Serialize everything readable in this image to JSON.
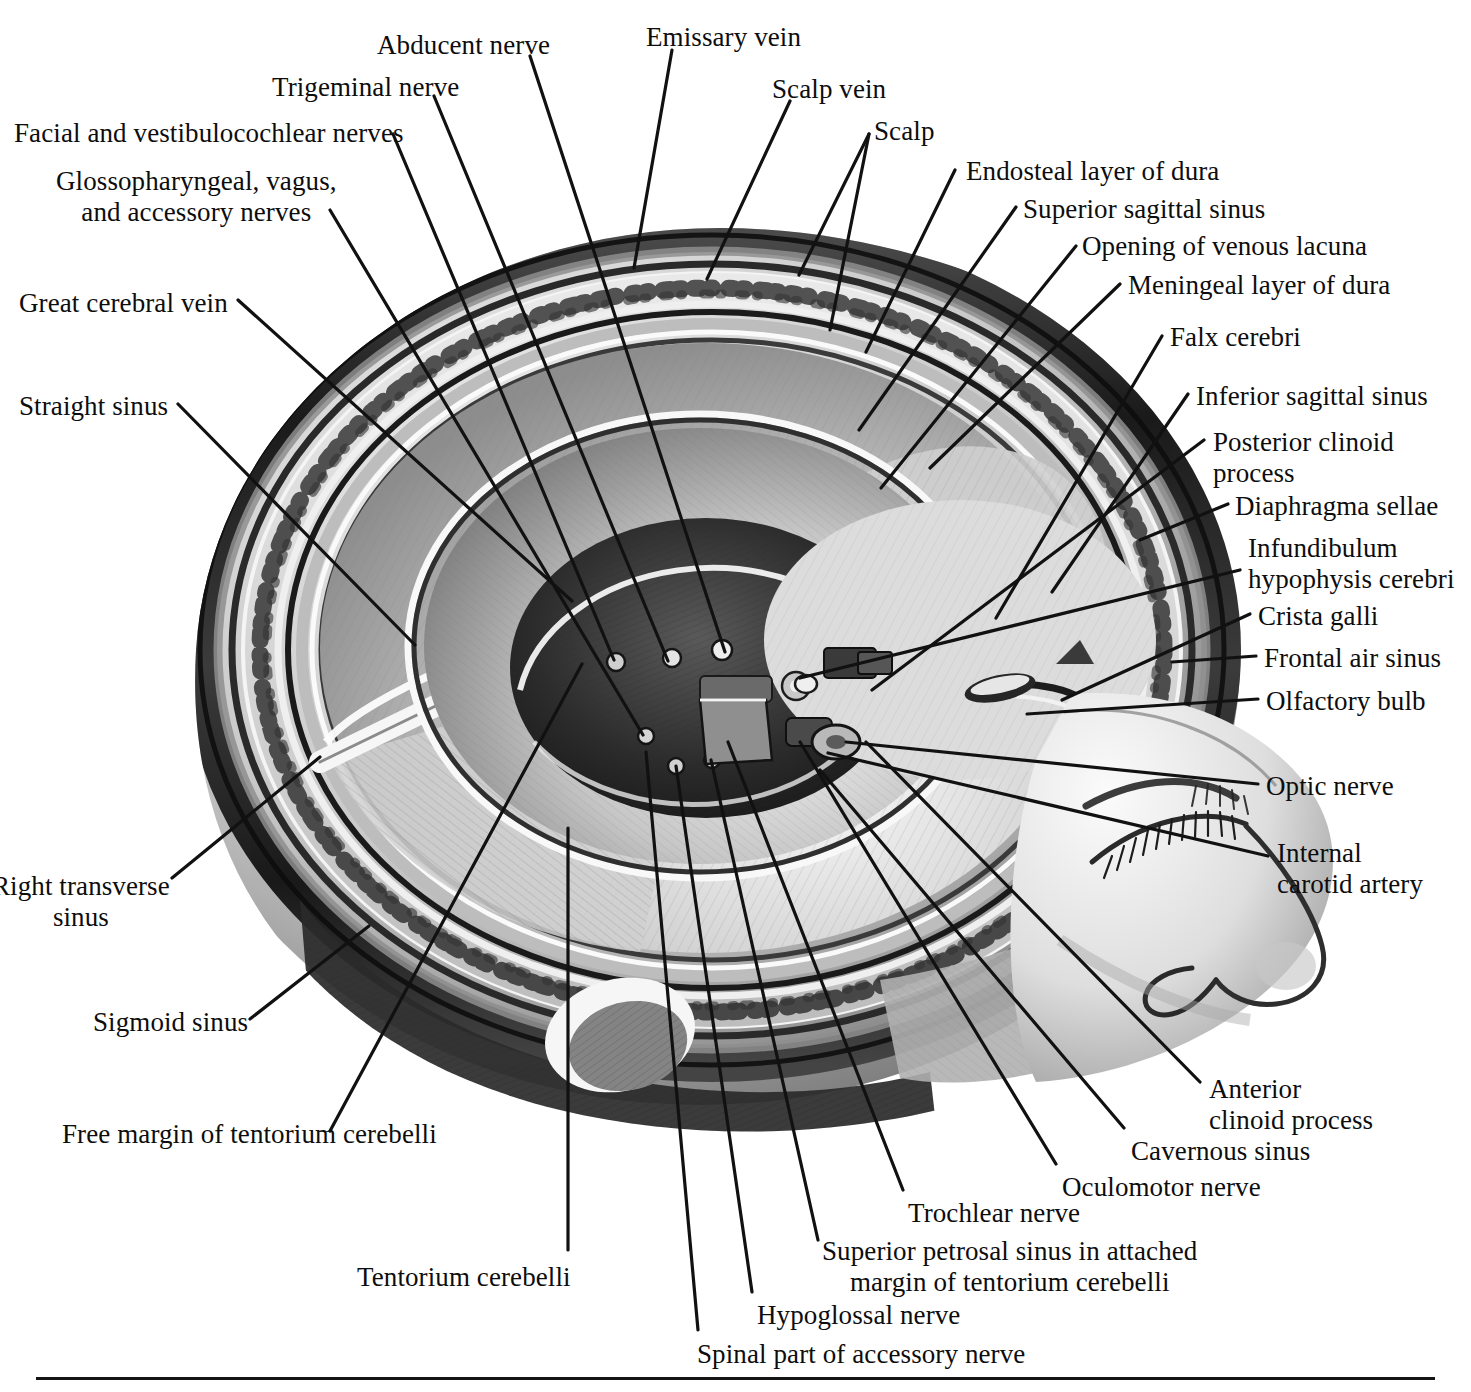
{
  "figure": {
    "domain": "anatomy-illustration",
    "style": "monochrome halftone engraving",
    "background_color": "#ffffff",
    "ink_color": "#0d0d0d",
    "leader_line_color": "#111111"
  },
  "labels": [
    {
      "id": "facial-vestibulocochlear-nerves",
      "text": "Facial and vestibulocochlear nerves",
      "lines": [
        "Facial and vestibulocochlear nerves"
      ],
      "align": "left",
      "x": 14,
      "y": 118
    },
    {
      "id": "glossopharyngeal-vagus-accessory-nerves",
      "text": "Glossopharyngeal, vagus, and accessory nerves",
      "lines": [
        "Glossopharyngeal, vagus,",
        "and accessory nerves"
      ],
      "align": "center",
      "x": 56,
      "y": 166
    },
    {
      "id": "trigeminal-nerve",
      "text": "Trigeminal nerve",
      "lines": [
        "Trigeminal nerve"
      ],
      "align": "left",
      "x": 272,
      "y": 72
    },
    {
      "id": "abducent-nerve",
      "text": "Abducent nerve",
      "lines": [
        "Abducent nerve"
      ],
      "align": "left",
      "x": 377,
      "y": 30
    },
    {
      "id": "emissary-vein",
      "text": "Emissary vein",
      "lines": [
        "Emissary vein"
      ],
      "align": "left",
      "x": 646,
      "y": 22
    },
    {
      "id": "scalp-vein",
      "text": "Scalp vein",
      "lines": [
        "Scalp vein"
      ],
      "align": "left",
      "x": 772,
      "y": 74
    },
    {
      "id": "scalp",
      "text": "Scalp",
      "lines": [
        "Scalp"
      ],
      "align": "left",
      "x": 874,
      "y": 116
    },
    {
      "id": "endosteal-layer-of-dura",
      "text": "Endosteal layer of dura",
      "lines": [
        "Endosteal layer of dura"
      ],
      "align": "left",
      "x": 966,
      "y": 156
    },
    {
      "id": "superior-sagittal-sinus",
      "text": "Superior sagittal sinus",
      "lines": [
        "Superior sagittal sinus"
      ],
      "align": "left",
      "x": 1023,
      "y": 194
    },
    {
      "id": "opening-of-venous-lacuna",
      "text": "Opening of venous lacuna",
      "lines": [
        "Opening of venous lacuna"
      ],
      "align": "left",
      "x": 1082,
      "y": 231
    },
    {
      "id": "meningeal-layer-of-dura",
      "text": "Meningeal layer of dura",
      "lines": [
        "Meningeal layer of dura"
      ],
      "align": "left",
      "x": 1128,
      "y": 270
    },
    {
      "id": "falx-cerebri",
      "text": "Falx cerebri",
      "lines": [
        "Falx cerebri"
      ],
      "align": "left",
      "x": 1170,
      "y": 322
    },
    {
      "id": "inferior-sagittal-sinus",
      "text": "Inferior sagittal sinus",
      "lines": [
        "Inferior sagittal sinus"
      ],
      "align": "left",
      "x": 1196,
      "y": 381
    },
    {
      "id": "posterior-clinoid-process",
      "text": "Posterior clinoid process",
      "lines": [
        "Posterior clinoid",
        "process"
      ],
      "align": "left",
      "x": 1213,
      "y": 427
    },
    {
      "id": "diaphragma-sellae",
      "text": "Diaphragma sellae",
      "lines": [
        "Diaphragma sellae"
      ],
      "align": "left",
      "x": 1235,
      "y": 491
    },
    {
      "id": "infundibulum-hypophysis-cerebri",
      "text": "Infundibulum hypophysis cerebri",
      "lines": [
        "Infundibulum",
        "hypophysis cerebri"
      ],
      "align": "left",
      "x": 1248,
      "y": 533
    },
    {
      "id": "crista-galli",
      "text": "Crista galli",
      "lines": [
        "Crista galli"
      ],
      "align": "left",
      "x": 1258,
      "y": 601
    },
    {
      "id": "frontal-air-sinus",
      "text": "Frontal air sinus",
      "lines": [
        "Frontal air sinus"
      ],
      "align": "left",
      "x": 1264,
      "y": 643
    },
    {
      "id": "olfactory-bulb",
      "text": "Olfactory bulb",
      "lines": [
        "Olfactory bulb"
      ],
      "align": "left",
      "x": 1266,
      "y": 686
    },
    {
      "id": "optic-nerve",
      "text": "Optic nerve",
      "lines": [
        "Optic nerve"
      ],
      "align": "left",
      "x": 1266,
      "y": 771
    },
    {
      "id": "internal-carotid-artery",
      "text": "Internal carotid artery",
      "lines": [
        "Internal",
        "carotid artery"
      ],
      "align": "left",
      "x": 1277,
      "y": 838
    },
    {
      "id": "great-cerebral-vein",
      "text": "Great cerebral vein",
      "lines": [
        "Great cerebral vein"
      ],
      "align": "left",
      "x": 19,
      "y": 288
    },
    {
      "id": "straight-sinus",
      "text": "Straight sinus",
      "lines": [
        "Straight sinus"
      ],
      "align": "left",
      "x": 19,
      "y": 391
    },
    {
      "id": "right-transverse-sinus",
      "text": "Right transverse sinus",
      "lines": [
        "Right transverse",
        "sinus"
      ],
      "align": "center",
      "x": -8,
      "y": 871
    },
    {
      "id": "sigmoid-sinus",
      "text": "Sigmoid sinus",
      "lines": [
        "Sigmoid sinus"
      ],
      "align": "left",
      "x": 93,
      "y": 1007
    },
    {
      "id": "free-margin-of-tentorium-cerebelli",
      "text": "Free margin of tentorium cerebelli",
      "lines": [
        "Free margin of tentorium cerebelli"
      ],
      "align": "left",
      "x": 62,
      "y": 1119
    },
    {
      "id": "tentorium-cerebelli",
      "text": "Tentorium cerebelli",
      "lines": [
        "Tentorium cerebelli"
      ],
      "align": "left",
      "x": 357,
      "y": 1262
    },
    {
      "id": "spinal-part-of-accessory-nerve",
      "text": "Spinal part of accessory nerve",
      "lines": [
        "Spinal part of accessory nerve"
      ],
      "align": "left",
      "x": 697,
      "y": 1339
    },
    {
      "id": "hypoglossal-nerve",
      "text": "Hypoglossal nerve",
      "lines": [
        "Hypoglossal nerve"
      ],
      "align": "left",
      "x": 757,
      "y": 1300
    },
    {
      "id": "superior-petrosal-sinus",
      "text": "Superior petrosal sinus in attached margin of tentorium cerebelli",
      "lines": [
        "Superior petrosal sinus in attached",
        "margin of tentorium cerebelli"
      ],
      "align": "center",
      "x": 822,
      "y": 1236
    },
    {
      "id": "trochlear-nerve",
      "text": "Trochlear nerve",
      "lines": [
        "Trochlear nerve"
      ],
      "align": "left",
      "x": 908,
      "y": 1198
    },
    {
      "id": "oculomotor-nerve",
      "text": "Oculomotor nerve",
      "lines": [
        "Oculomotor nerve"
      ],
      "align": "left",
      "x": 1062,
      "y": 1172
    },
    {
      "id": "cavernous-sinus",
      "text": "Cavernous sinus",
      "lines": [
        "Cavernous sinus"
      ],
      "align": "left",
      "x": 1131,
      "y": 1136
    },
    {
      "id": "anterior-clinoid-process",
      "text": "Anterior clinoid process",
      "lines": [
        "Anterior",
        "clinoid process"
      ],
      "align": "left",
      "x": 1209,
      "y": 1074
    }
  ],
  "leader_lines": [
    {
      "id": "leader-facial-vestibulocochlear",
      "points": "393,134 614,660"
    },
    {
      "id": "leader-glossopharyngeal",
      "points": "330,210 643,735"
    },
    {
      "id": "leader-trigeminal",
      "points": "434,96 668,661"
    },
    {
      "id": "leader-abducent",
      "points": "530,56 725,652"
    },
    {
      "id": "leader-emissary",
      "points": "672,50 634,268"
    },
    {
      "id": "leader-scalp-vein",
      "points": "790,101 707,279"
    },
    {
      "id": "leader-scalp-a",
      "points": "869,134 799,275"
    },
    {
      "id": "leader-scalp-b",
      "points": "869,134 830,330"
    },
    {
      "id": "leader-endosteal",
      "points": "955,170 866,352"
    },
    {
      "id": "leader-superior-sagittal",
      "points": "1016,207 859,430"
    },
    {
      "id": "leader-opening-venous-lacuna",
      "points": "1076,246 881,488"
    },
    {
      "id": "leader-meningeal",
      "points": "1120,284 930,468"
    },
    {
      "id": "leader-falx",
      "points": "1162,336 996,618"
    },
    {
      "id": "leader-inferior-sagittal",
      "points": "1188,394 1052,592"
    },
    {
      "id": "leader-posterior-clinoid",
      "points": "1204,440 872,690"
    },
    {
      "id": "leader-diaphragma",
      "points": "1228,504 1140,540"
    },
    {
      "id": "leader-infundibulum",
      "points": "1240,570 800,678"
    },
    {
      "id": "leader-crista-galli",
      "points": "1250,614 1062,700"
    },
    {
      "id": "leader-frontal-air-sinus",
      "points": "1256,656 1172,662"
    },
    {
      "id": "leader-olfactory-bulb",
      "points": "1258,699 1027,714"
    },
    {
      "id": "leader-optic-nerve",
      "points": "1258,784 846,742"
    },
    {
      "id": "leader-internal-carotid",
      "points": "1268,856 828,753"
    },
    {
      "id": "leader-great-cerebral-vein",
      "points": "238,300 572,601"
    },
    {
      "id": "leader-straight-sinus",
      "points": "178,404 415,645"
    },
    {
      "id": "leader-right-transverse",
      "points": "172,878 320,757"
    },
    {
      "id": "leader-sigmoid-sinus",
      "points": "250,1019 369,926"
    },
    {
      "id": "leader-free-margin-tentorium",
      "points": "330,1131 582,664"
    },
    {
      "id": "leader-tentorium-cerebelli",
      "points": "568,1250 568,828"
    },
    {
      "id": "leader-spinal-accessory",
      "points": "698,1330 646,752"
    },
    {
      "id": "leader-hypoglossal",
      "points": "752,1292 676,766"
    },
    {
      "id": "leader-superior-petrosal",
      "points": "818,1240 711,760"
    },
    {
      "id": "leader-trochlear",
      "points": "903,1190 728,742"
    },
    {
      "id": "leader-oculomotor",
      "points": "1056,1164 800,742"
    },
    {
      "id": "leader-cavernous-sinus",
      "points": "1124,1128 820,770"
    },
    {
      "id": "leader-anterior-clinoid",
      "points": "1200,1082 866,742"
    }
  ],
  "rule": {
    "id": "bottom-rule",
    "color": "#141414"
  }
}
